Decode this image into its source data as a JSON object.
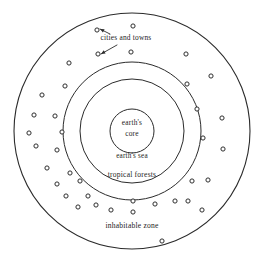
{
  "figure": {
    "type": "concentric-zone-diagram",
    "background_color": "#ffffff",
    "stroke_color": "#2b2b2b",
    "text_color": "#1c1c1c"
  },
  "labels": {
    "cities_and_towns": "cities and towns",
    "earths_core_line1": "earth's",
    "earths_core_line2": "core",
    "earths_sea": "earth's sea",
    "tropical_forests": "tropical forests",
    "inhabitable_zone": "inhabitable zone"
  },
  "chart_data": {
    "type": "scatter",
    "title": "",
    "xlabel": "",
    "ylabel": "",
    "grid": false,
    "legend": "none",
    "center": {
      "x": 132,
      "y": 131
    },
    "rings": [
      {
        "name": "inhabitable zone",
        "radius": 118,
        "label": "inhabitable zone",
        "label_x": 132,
        "label_y": 228
      },
      {
        "name": "tropical forests",
        "radius": 69,
        "label": "tropical forests",
        "label_x": 132,
        "label_y": 177
      },
      {
        "name": "earth's sea",
        "radius": 52,
        "label": "earth's sea",
        "label_x": 132,
        "label_y": 158
      },
      {
        "name": "earth's core",
        "radius": 22,
        "label": "earth's core",
        "label_x": 132,
        "label_y": 128
      }
    ],
    "annotation": {
      "text": "cities and towns",
      "text_x": 126,
      "text_y": 40,
      "leaders": [
        {
          "from_x": 110,
          "from_y": 34,
          "to_x": 100,
          "to_y": 29
        },
        {
          "from_x": 117,
          "from_y": 45,
          "to_x": 101,
          "to_y": 54
        }
      ]
    },
    "dot_radius": 2.1,
    "dots": [
      {
        "x": 97,
        "y": 30
      },
      {
        "x": 133,
        "y": 26
      },
      {
        "x": 98,
        "y": 54
      },
      {
        "x": 131,
        "y": 52
      },
      {
        "x": 186,
        "y": 54
      },
      {
        "x": 69,
        "y": 63
      },
      {
        "x": 211,
        "y": 76
      },
      {
        "x": 65,
        "y": 86
      },
      {
        "x": 42,
        "y": 95
      },
      {
        "x": 187,
        "y": 84
      },
      {
        "x": 34,
        "y": 115
      },
      {
        "x": 55,
        "y": 116
      },
      {
        "x": 197,
        "y": 109
      },
      {
        "x": 222,
        "y": 118
      },
      {
        "x": 29,
        "y": 133
      },
      {
        "x": 62,
        "y": 132
      },
      {
        "x": 57,
        "y": 150
      },
      {
        "x": 36,
        "y": 146
      },
      {
        "x": 203,
        "y": 138
      },
      {
        "x": 223,
        "y": 149
      },
      {
        "x": 47,
        "y": 168
      },
      {
        "x": 70,
        "y": 173
      },
      {
        "x": 57,
        "y": 184
      },
      {
        "x": 80,
        "y": 181
      },
      {
        "x": 192,
        "y": 181
      },
      {
        "x": 208,
        "y": 180
      },
      {
        "x": 66,
        "y": 196
      },
      {
        "x": 88,
        "y": 196
      },
      {
        "x": 96,
        "y": 205
      },
      {
        "x": 78,
        "y": 207
      },
      {
        "x": 133,
        "y": 201
      },
      {
        "x": 155,
        "y": 204
      },
      {
        "x": 175,
        "y": 201
      },
      {
        "x": 188,
        "y": 201
      },
      {
        "x": 111,
        "y": 210
      },
      {
        "x": 133,
        "y": 212
      },
      {
        "x": 202,
        "y": 210
      },
      {
        "x": 162,
        "y": 241
      }
    ]
  }
}
